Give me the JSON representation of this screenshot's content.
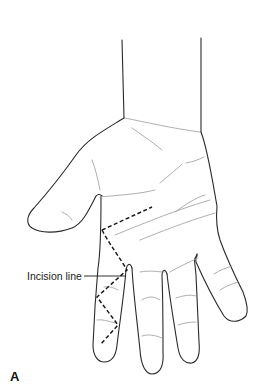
{
  "figure": {
    "panel_label": "A",
    "annotations": [
      {
        "id": "incision",
        "text": "Incision line"
      }
    ],
    "colors": {
      "outline": "#2a2a2a",
      "crease": "#9a9a9a",
      "incision": "#1a1a1a",
      "background": "#ffffff"
    }
  }
}
